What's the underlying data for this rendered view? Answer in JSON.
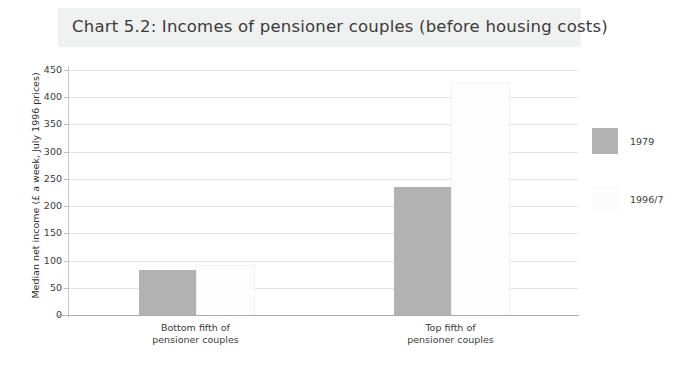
{
  "chart_data": {
    "type": "bar",
    "title": "Chart 5.2: Incomes of pensioner couples (before housing costs)",
    "xlabel": "",
    "ylabel": "Median net income (£ a week, July 1996 prices)",
    "categories": [
      "Bottom fifth of pensioner couples",
      "Top fifth of pensioner couples"
    ],
    "categories_lines": [
      [
        "Bottom fifth of",
        "pensioner couples"
      ],
      [
        "Top fifth of",
        "pensioner couples"
      ]
    ],
    "series": [
      {
        "name": "1979",
        "color": "#b2b2b2",
        "values": [
          82,
          235
        ]
      },
      {
        "name": "1996/7",
        "color": "#fcfcfc",
        "values": [
          90,
          425
        ]
      }
    ],
    "ylim": [
      0,
      450
    ],
    "ytick_step": 50,
    "yticks": [
      450,
      400,
      350,
      300,
      250,
      200,
      150,
      100,
      50,
      0
    ],
    "grid": true,
    "legend_position": "right"
  },
  "legend": {
    "entries": [
      {
        "label": "1979",
        "color": "#b2b2b2"
      },
      {
        "label": "1996/7",
        "color": "#fcfcfc"
      }
    ]
  },
  "colors": {
    "title_band": "#eff0f0",
    "gridline": "#e3e4e4",
    "axis": "#aaaaaa",
    "text": "#3a3a3a"
  }
}
